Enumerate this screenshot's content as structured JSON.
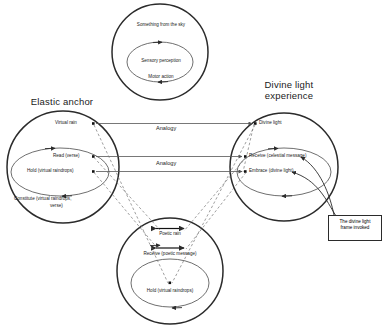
{
  "diagram": {
    "title_top_circle": "Something from the sky",
    "titles": {
      "left": "Elastic anchor",
      "right_line1": "Divine light",
      "right_line2": "experience"
    },
    "top_frame": {
      "outer_label": "Something from the sky",
      "inner_label_1": "Sensory perception",
      "inner_label_2": "Motor action"
    },
    "left_frame": {
      "title": "Elastic anchor",
      "outer_label": "Virtual rain",
      "inner_label_1": "Read (verse)",
      "inner_label_2": "Hold (virtual raindrops)",
      "bottom_label_1": "Constitute (virtual raindrops,",
      "bottom_label_2": "verse)"
    },
    "right_frame": {
      "title_line1": "Divine light",
      "title_line2": "experience",
      "outer_label": "Divine light",
      "inner_label_1": "Receive (celestial message)",
      "inner_label_2": "Embrace (divine light)"
    },
    "bottom_frame": {
      "outer_label": "Poetic rain",
      "inner_label_1": "Receive (poetic message)",
      "inner_label_2": "Hold (virtual raindrops)"
    },
    "connectors": {
      "analogy_top": "Analogy",
      "analogy_bottom": "Analogy"
    },
    "callout": {
      "line1": "The divine light",
      "line2": "frame invoked"
    },
    "colors": {
      "stroke_strong": "#2b2b2b",
      "stroke_light": "#6f6f6f",
      "text": "#1a1a1a",
      "background": "#ffffff"
    }
  }
}
